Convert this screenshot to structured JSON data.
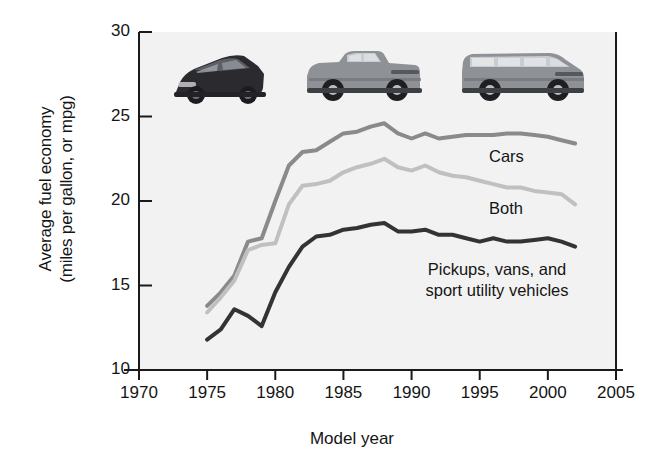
{
  "chart_data": {
    "type": "line",
    "title": "",
    "xlabel": "Model year",
    "ylabel": "Average fuel economy\n(miles per gallon, or mpg)",
    "xlim": [
      1970,
      2005
    ],
    "ylim": [
      10,
      30
    ],
    "xticks": [
      1970,
      1975,
      1980,
      1985,
      1990,
      1995,
      2000,
      2005
    ],
    "yticks": [
      10,
      15,
      20,
      25,
      30
    ],
    "grid": false,
    "legend_position": "inline-right",
    "x": [
      1975,
      1976,
      1977,
      1978,
      1979,
      1980,
      1981,
      1982,
      1983,
      1984,
      1985,
      1986,
      1987,
      1988,
      1989,
      1990,
      1991,
      1992,
      1993,
      1994,
      1995,
      1996,
      1997,
      1998,
      1999,
      2000,
      2001,
      2002
    ],
    "series": [
      {
        "name": "Cars",
        "color": "#8a8a8a",
        "values": [
          13.8,
          14.6,
          15.6,
          17.6,
          17.8,
          20.0,
          22.1,
          22.9,
          23.0,
          23.5,
          24.0,
          24.1,
          24.4,
          24.6,
          24.0,
          23.7,
          24.0,
          23.7,
          23.8,
          23.9,
          23.9,
          23.9,
          24.0,
          24.0,
          23.9,
          23.8,
          23.6,
          23.4
        ]
      },
      {
        "name": "Both",
        "color": "#c0c0c0",
        "values": [
          13.4,
          14.3,
          15.3,
          17.1,
          17.4,
          17.5,
          19.8,
          20.9,
          21.0,
          21.2,
          21.7,
          22.0,
          22.2,
          22.5,
          22.0,
          21.8,
          22.1,
          21.7,
          21.5,
          21.4,
          21.2,
          21.0,
          20.8,
          20.8,
          20.6,
          20.5,
          20.4,
          19.8
        ]
      },
      {
        "name": "Pickups, vans, and\nsport utility vehicles",
        "color": "#333333",
        "values": [
          11.8,
          12.4,
          13.6,
          13.2,
          12.6,
          14.6,
          16.1,
          17.3,
          17.9,
          18.0,
          18.3,
          18.4,
          18.6,
          18.7,
          18.2,
          18.2,
          18.3,
          18.0,
          18.0,
          17.8,
          17.6,
          17.8,
          17.6,
          17.6,
          17.7,
          17.8,
          17.6,
          17.3
        ]
      }
    ],
    "annotations": [
      {
        "text": "Cars",
        "x": 1995.5,
        "y": 22.0
      },
      {
        "text": "Both",
        "x": 1995.5,
        "y": 18.9
      },
      {
        "text": "Pickups, vans, and sport utility vehicles",
        "x": 1993.0,
        "y": 15.9
      }
    ]
  },
  "axis": {
    "ylabel_line1": "Average fuel economy",
    "ylabel_line2": "(miles per gallon, or mpg)",
    "xlabel": "Model year"
  },
  "vehicle_images": [
    {
      "name": "sedan-car-image",
      "label": "dark sedan"
    },
    {
      "name": "pickup-truck-image",
      "label": "gray pickup truck"
    },
    {
      "name": "suv-image",
      "label": "gray sport utility vehicle"
    }
  ]
}
